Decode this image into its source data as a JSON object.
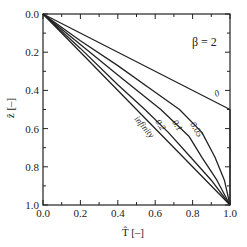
{
  "chart_data": {
    "type": "line",
    "title": "",
    "annotation": "β = 2",
    "xlabel": "T̂ [–]",
    "ylabel": "ẑ [–]",
    "xlim": [
      0.0,
      1.0
    ],
    "ylim": [
      0.0,
      1.0
    ],
    "y_inverted": true,
    "grid": false,
    "x_ticks": [
      "0.0",
      "0.2",
      "0.4",
      "0.6",
      "0.8",
      "1.0"
    ],
    "y_ticks": [
      "0.0",
      "0.2",
      "0.4",
      "0.6",
      "0.8",
      "1.0"
    ],
    "series": [
      {
        "name": "0",
        "x": [
          0.0,
          1.0,
          1.0
        ],
        "y": [
          0.0,
          0.5,
          1.0
        ]
      },
      {
        "name": "0.05",
        "x": [
          0.0,
          0.2,
          0.4,
          0.6,
          0.73,
          0.85,
          0.92,
          0.97,
          1.0
        ],
        "y": [
          0.0,
          0.14,
          0.27,
          0.41,
          0.5,
          0.62,
          0.75,
          0.87,
          1.0
        ]
      },
      {
        "name": "0.1",
        "x": [
          0.0,
          0.2,
          0.4,
          0.63,
          0.78,
          0.85,
          0.93,
          1.0
        ],
        "y": [
          0.0,
          0.16,
          0.32,
          0.5,
          0.64,
          0.75,
          0.87,
          1.0
        ]
      },
      {
        "name": "0.2",
        "x": [
          0.0,
          0.2,
          0.4,
          0.545,
          0.67,
          0.79,
          0.9,
          1.0
        ],
        "y": [
          0.0,
          0.18,
          0.37,
          0.5,
          0.62,
          0.75,
          0.87,
          1.0
        ]
      },
      {
        "name": "infinity",
        "x": [
          0.0,
          0.25,
          0.5,
          0.75,
          1.0
        ],
        "y": [
          0.0,
          0.25,
          0.5,
          0.75,
          1.0
        ]
      }
    ],
    "curve_labels": [
      "0",
      "0.05",
      "0.1",
      "0.2",
      "infinity"
    ]
  }
}
